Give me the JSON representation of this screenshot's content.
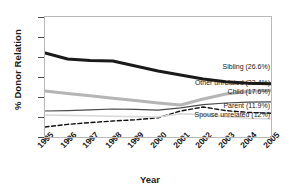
{
  "chart_data": {
    "type": "line",
    "title": "",
    "xlabel": "Year",
    "ylabel": "% Donor Relation",
    "categories": [
      "1995",
      "1996",
      "1997",
      "1998",
      "1999",
      "2000",
      "2001",
      "2002",
      "2003",
      "2004",
      "2005"
    ],
    "x": [
      1995,
      1996,
      1997,
      1998,
      1999,
      2000,
      2001,
      2002,
      2003,
      2004,
      2005
    ],
    "xlim": [
      1995,
      2005
    ],
    "ylim": [
      0,
      60
    ],
    "yticks": [
      0,
      10,
      20,
      30,
      40,
      50,
      60
    ],
    "grid": false,
    "legend_position": "inline-right",
    "series": [
      {
        "name": "Sibling",
        "label": "Sibling (26.6%)",
        "final_value": 26.6,
        "color": "#1a1a1a",
        "style": "solid",
        "width": 3.0,
        "values": [
          42.0,
          39.0,
          38.3,
          38.0,
          35.5,
          33.0,
          31.0,
          29.0,
          27.6,
          26.9,
          26.6
        ]
      },
      {
        "name": "Other unrelated",
        "label": "Other unrelated (23.4%)",
        "final_value": 23.4,
        "color": "#b5b5b5",
        "style": "solid",
        "width": 3.0,
        "values": [
          23.0,
          21.8,
          20.6,
          19.4,
          18.2,
          17.0,
          16.0,
          19.0,
          21.5,
          22.8,
          23.4
        ]
      },
      {
        "name": "Child",
        "label": "Child (17.6%)",
        "final_value": 17.6,
        "color": "#4a4a4a",
        "style": "solid",
        "width": 1.2,
        "values": [
          13.0,
          13.2,
          13.6,
          14.0,
          13.8,
          13.4,
          14.6,
          16.2,
          17.0,
          17.4,
          17.6
        ]
      },
      {
        "name": "Parent",
        "label": "Parent (11.9%)",
        "final_value": 11.9,
        "color": "#111111",
        "style": "dashed",
        "width": 1.4,
        "values": [
          5.0,
          6.3,
          7.2,
          8.0,
          8.6,
          9.6,
          13.0,
          15.0,
          13.2,
          12.3,
          11.9
        ]
      },
      {
        "name": "Spouse unrelated",
        "label": "Spouse unrelated (12%)",
        "final_value": 12.0,
        "color": "#d8d8d8",
        "style": "solid",
        "width": 1.6,
        "values": [
          11.0,
          10.8,
          10.6,
          10.4,
          10.2,
          10.0,
          11.6,
          11.2,
          10.2,
          9.4,
          9.0
        ]
      }
    ]
  }
}
